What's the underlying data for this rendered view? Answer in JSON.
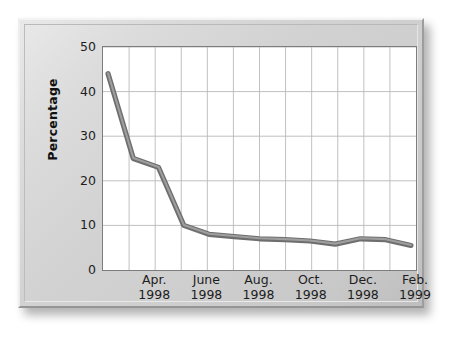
{
  "chart_data": {
    "type": "line",
    "title": "",
    "xlabel": "",
    "ylabel": "Percentage",
    "ylim": [
      0,
      50
    ],
    "yticks": [
      0,
      10,
      20,
      30,
      40,
      50
    ],
    "ytick_labels": [
      "0",
      "10",
      "20",
      "30",
      "40",
      "50"
    ],
    "grid": true,
    "grid_color": "#b9b9b9",
    "legend": "none",
    "line_color": "#6e6e6e",
    "line_highlight_color": "#9e9e9e",
    "plot_background": "#ffffff",
    "frame_color": "#d2d2d2",
    "x_tick_labels": [
      {
        "month": "Apr.",
        "year": "1998"
      },
      {
        "month": "June",
        "year": "1998"
      },
      {
        "month": "Aug.",
        "year": "1998"
      },
      {
        "month": "Oct.",
        "year": "1998"
      },
      {
        "month": "Dec.",
        "year": "1998"
      },
      {
        "month": "Feb.",
        "year": "1999"
      }
    ],
    "categories": [
      "Feb. 1998",
      "Mar. 1998",
      "Apr. 1998",
      "May 1998",
      "June 1998",
      "July 1998",
      "Aug. 1998",
      "Sep. 1998",
      "Oct. 1998",
      "Nov. 1998",
      "Dec. 1998",
      "Jan. 1999",
      "Feb. 1999"
    ],
    "values": [
      44,
      25,
      23,
      10,
      8,
      7.5,
      7,
      6.8,
      6.5,
      5.8,
      7,
      6.8,
      5.5
    ],
    "x_index": [
      0,
      1,
      2,
      3,
      4,
      5,
      6,
      7,
      8,
      9,
      10,
      11,
      12
    ],
    "xlim_index": [
      -0.2,
      12.2
    ],
    "n_vertical_gridlines": 12
  }
}
